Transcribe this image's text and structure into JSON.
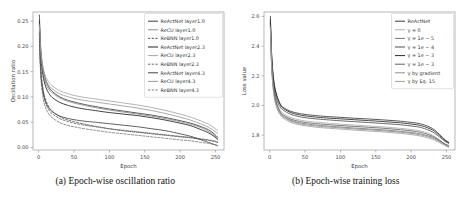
{
  "figure": {
    "panel_a_caption": "(a) Epoch-wise oscillation ratio",
    "panel_b_caption": "(b) Epoch-wise training loss"
  },
  "chart_data": [
    {
      "id": "panel-a",
      "type": "line",
      "title": "",
      "xlabel": "Epoch",
      "ylabel": "Oscillation ratio",
      "xlim": [
        -8,
        262
      ],
      "ylim": [
        -0.005,
        0.268
      ],
      "xticks": [
        0,
        50,
        100,
        150,
        200,
        250
      ],
      "xticklabels": [
        "0",
        "50",
        "100",
        "150",
        "200",
        "250"
      ],
      "yticks": [
        0.0,
        0.05,
        0.1,
        0.15,
        0.2,
        0.25
      ],
      "yticklabels": [
        "0.00",
        "0.05",
        "0.10",
        "0.15",
        "0.20",
        "0.25"
      ],
      "grid": false,
      "legend_position": "upper right",
      "x": [
        1,
        3,
        6,
        10,
        15,
        20,
        30,
        40,
        50,
        65,
        80,
        100,
        120,
        140,
        160,
        180,
        200,
        215,
        230,
        240,
        248,
        253
      ],
      "series": [
        {
          "name": "ReActNet layer1.0",
          "color": "#3d3d3d",
          "dash": "solid",
          "width": 0.85,
          "values": [
            0.262,
            0.196,
            0.158,
            0.133,
            0.118,
            0.11,
            0.1,
            0.094,
            0.09,
            0.085,
            0.081,
            0.076,
            0.072,
            0.068,
            0.064,
            0.059,
            0.053,
            0.048,
            0.041,
            0.035,
            0.027,
            0.02
          ]
        },
        {
          "name": "ReCU layer1.0",
          "color": "#8c8c8c",
          "dash": "solid",
          "width": 0.85,
          "values": [
            0.245,
            0.186,
            0.15,
            0.127,
            0.114,
            0.107,
            0.098,
            0.092,
            0.088,
            0.083,
            0.079,
            0.074,
            0.07,
            0.066,
            0.062,
            0.057,
            0.051,
            0.046,
            0.039,
            0.032,
            0.024,
            0.017
          ]
        },
        {
          "name": "ReBNN layer1.0",
          "color": "#4a4a4a",
          "dash": "dashed",
          "width": 0.8,
          "values": [
            0.232,
            0.16,
            0.118,
            0.094,
            0.079,
            0.071,
            0.061,
            0.055,
            0.051,
            0.046,
            0.042,
            0.037,
            0.033,
            0.03,
            0.027,
            0.024,
            0.021,
            0.019,
            0.016,
            0.014,
            0.012,
            0.01
          ]
        },
        {
          "name": "ReActNet layer2.3",
          "color": "#2e2e2e",
          "dash": "solid",
          "width": 0.9,
          "values": [
            0.25,
            0.182,
            0.144,
            0.12,
            0.106,
            0.098,
            0.089,
            0.084,
            0.08,
            0.076,
            0.073,
            0.069,
            0.066,
            0.063,
            0.059,
            0.054,
            0.048,
            0.043,
            0.035,
            0.029,
            0.022,
            0.016
          ]
        },
        {
          "name": "ReCU layer2.3",
          "color": "#a5a5a5",
          "dash": "solid",
          "width": 0.85,
          "values": [
            0.238,
            0.19,
            0.16,
            0.14,
            0.128,
            0.121,
            0.112,
            0.107,
            0.103,
            0.099,
            0.096,
            0.092,
            0.088,
            0.084,
            0.079,
            0.073,
            0.066,
            0.06,
            0.052,
            0.046,
            0.039,
            0.033
          ]
        },
        {
          "name": "ReBNN layer2.3",
          "color": "#5a5a5a",
          "dash": "dashed",
          "width": 0.8,
          "values": [
            0.225,
            0.15,
            0.11,
            0.087,
            0.073,
            0.066,
            0.057,
            0.052,
            0.048,
            0.044,
            0.041,
            0.037,
            0.034,
            0.031,
            0.028,
            0.025,
            0.022,
            0.02,
            0.017,
            0.015,
            0.013,
            0.011
          ]
        },
        {
          "name": "ReActNet layer4.3",
          "color": "#444444",
          "dash": "solid",
          "width": 0.85,
          "values": [
            0.228,
            0.15,
            0.112,
            0.09,
            0.077,
            0.07,
            0.062,
            0.058,
            0.055,
            0.052,
            0.05,
            0.047,
            0.044,
            0.041,
            0.037,
            0.033,
            0.027,
            0.022,
            0.015,
            0.01,
            0.006,
            0.003
          ]
        },
        {
          "name": "ReCU layer4.3",
          "color": "#999999",
          "dash": "solid",
          "width": 0.85,
          "values": [
            0.243,
            0.188,
            0.155,
            0.134,
            0.122,
            0.115,
            0.106,
            0.101,
            0.097,
            0.093,
            0.09,
            0.086,
            0.082,
            0.078,
            0.073,
            0.067,
            0.06,
            0.054,
            0.046,
            0.04,
            0.033,
            0.028
          ]
        },
        {
          "name": "ReBNN layer4.3",
          "color": "#6e6e6e",
          "dash": "dashed",
          "width": 0.8,
          "values": [
            0.215,
            0.14,
            0.1,
            0.078,
            0.065,
            0.058,
            0.049,
            0.044,
            0.041,
            0.037,
            0.034,
            0.03,
            0.027,
            0.024,
            0.021,
            0.018,
            0.015,
            0.013,
            0.01,
            0.008,
            0.006,
            0.004
          ]
        }
      ]
    },
    {
      "id": "panel-b",
      "type": "line",
      "title": "",
      "xlabel": "Epoch",
      "ylabel": "Loss value",
      "xlim": [
        -8,
        262
      ],
      "ylim": [
        1.7,
        2.63
      ],
      "xticks": [
        0,
        50,
        100,
        150,
        200,
        250
      ],
      "xticklabels": [
        "0",
        "50",
        "100",
        "150",
        "200",
        "250"
      ],
      "yticks": [
        1.8,
        2.0,
        2.2,
        2.4,
        2.6
      ],
      "yticklabels": [
        "1.8",
        "2.0",
        "2.2",
        "2.4",
        "2.6"
      ],
      "grid": false,
      "legend_position": "upper right",
      "x": [
        1,
        3,
        6,
        10,
        15,
        20,
        30,
        40,
        50,
        65,
        80,
        100,
        120,
        140,
        160,
        180,
        200,
        215,
        230,
        240,
        248,
        253
      ],
      "series": [
        {
          "name": "ReActNet",
          "color": "#3a3a3a",
          "dash": "solid",
          "width": 0.85,
          "values": [
            2.6,
            2.33,
            2.16,
            2.07,
            2.01,
            1.985,
            1.96,
            1.948,
            1.94,
            1.932,
            1.926,
            1.92,
            1.914,
            1.909,
            1.903,
            1.896,
            1.886,
            1.874,
            1.845,
            1.805,
            1.768,
            1.752
          ]
        },
        {
          "name": "γ = 0",
          "color": "#adadad",
          "dash": "solid",
          "width": 0.85,
          "values": [
            2.57,
            2.28,
            2.11,
            2.02,
            1.968,
            1.944,
            1.918,
            1.905,
            1.896,
            1.888,
            1.882,
            1.874,
            1.868,
            1.862,
            1.856,
            1.848,
            1.838,
            1.826,
            1.8,
            1.768,
            1.74,
            1.728
          ]
        },
        {
          "name": "γ = 1e − 5",
          "color": "#777777",
          "dash": "solid",
          "width": 0.85,
          "values": [
            2.55,
            2.26,
            2.09,
            2.0,
            1.95,
            1.926,
            1.9,
            1.886,
            1.877,
            1.868,
            1.862,
            1.855,
            1.848,
            1.842,
            1.836,
            1.828,
            1.818,
            1.806,
            1.786,
            1.762,
            1.74,
            1.73
          ]
        },
        {
          "name": "γ = 1e − 4",
          "color": "#4f4f4f",
          "dash": "solid",
          "width": 0.85,
          "values": [
            2.56,
            2.3,
            2.13,
            2.04,
            1.99,
            1.966,
            1.94,
            1.927,
            1.918,
            1.91,
            1.904,
            1.897,
            1.891,
            1.885,
            1.879,
            1.872,
            1.862,
            1.85,
            1.822,
            1.788,
            1.758,
            1.745
          ]
        },
        {
          "name": "γ = 1e − 3",
          "color": "#2b2b2b",
          "dash": "solid",
          "width": 0.85,
          "values": [
            2.58,
            2.32,
            2.155,
            2.065,
            2.005,
            1.978,
            1.952,
            1.939,
            1.93,
            1.922,
            1.916,
            1.91,
            1.904,
            1.898,
            1.892,
            1.885,
            1.875,
            1.863,
            1.835,
            1.798,
            1.764,
            1.75
          ]
        },
        {
          "name": "γ = 1e − 3",
          "color": "#626262",
          "dash": "solid",
          "width": 0.85,
          "values": [
            2.54,
            2.27,
            2.1,
            2.01,
            1.958,
            1.934,
            1.908,
            1.895,
            1.886,
            1.878,
            1.872,
            1.865,
            1.859,
            1.853,
            1.847,
            1.839,
            1.829,
            1.817,
            1.793,
            1.765,
            1.738,
            1.726
          ]
        },
        {
          "name": "γ by gradient",
          "color": "#8f8f8f",
          "dash": "solid",
          "width": 0.85,
          "values": [
            2.53,
            2.25,
            2.08,
            1.995,
            1.944,
            1.92,
            1.894,
            1.88,
            1.871,
            1.862,
            1.856,
            1.849,
            1.842,
            1.836,
            1.83,
            1.822,
            1.812,
            1.8,
            1.78,
            1.756,
            1.734,
            1.722
          ]
        },
        {
          "name": "γ by Eq. 15",
          "color": "#a0a0a0",
          "dash": "solid",
          "width": 0.85,
          "values": [
            2.52,
            2.24,
            2.07,
            1.985,
            1.936,
            1.912,
            1.886,
            1.872,
            1.863,
            1.854,
            1.848,
            1.841,
            1.834,
            1.828,
            1.822,
            1.814,
            1.804,
            1.792,
            1.772,
            1.75,
            1.73,
            1.718
          ]
        }
      ]
    }
  ]
}
